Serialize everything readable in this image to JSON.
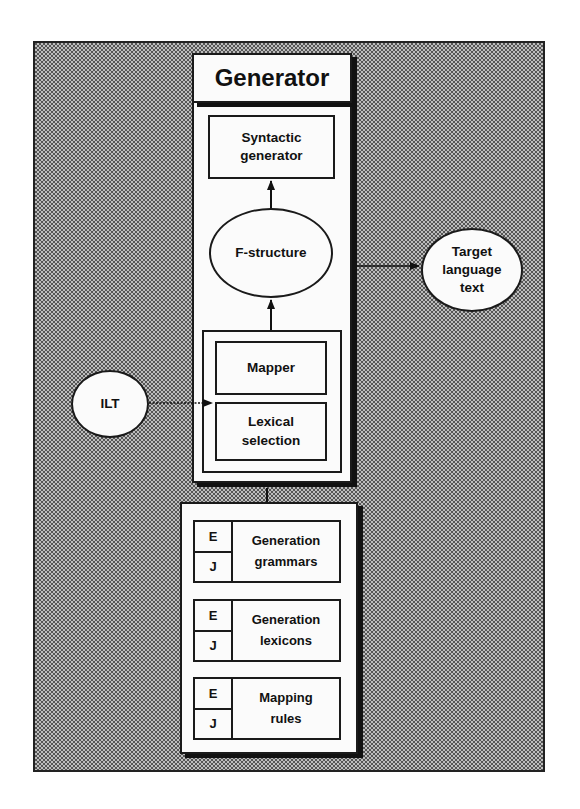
{
  "diagram": {
    "title": "Generator",
    "nodes": {
      "syntactic_generator": "Syntactic\ngenerator",
      "f_structure": "F-structure",
      "target_language_text": "Target\nlanguage\ntext",
      "mapper": "Mapper",
      "lexical_selection": "Lexical\nselection",
      "ilt": "ILT"
    },
    "knowledge_bases": [
      {
        "languages": [
          "E",
          "J"
        ],
        "name": "Generation\ngrammars"
      },
      {
        "languages": [
          "E",
          "J"
        ],
        "name": "Generation\nlexicons"
      },
      {
        "languages": [
          "E",
          "J"
        ],
        "name": "Mapping\nrules"
      }
    ],
    "edges": [
      {
        "from": "F-structure",
        "to": "Syntactic generator",
        "style": "solid"
      },
      {
        "from": "Mapper/Lexical selection",
        "to": "F-structure",
        "style": "solid"
      },
      {
        "from": "Generator",
        "to": "Target language text",
        "style": "solid"
      },
      {
        "from": "ILT",
        "to": "Lexical selection",
        "style": "dotted"
      },
      {
        "from": "Knowledge bases",
        "to": "Generator",
        "style": "line"
      }
    ],
    "colors": {
      "background_pattern": "#bdbdbd",
      "box_fill": "#fbfbfb",
      "stroke": "#1a1a1a"
    }
  }
}
